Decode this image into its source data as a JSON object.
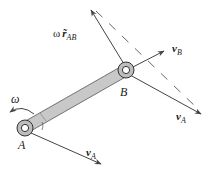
{
  "diagram": {
    "type": "rigid-body-velocity-diagram",
    "points": {
      "A": {
        "label": "A"
      },
      "B": {
        "label": "B"
      }
    },
    "labels": {
      "omega": "ω",
      "omega_r_prefix": "ω",
      "r_symbol": "r̃",
      "r_subscript": "AB",
      "vB_main": "v",
      "vB_sub": "B",
      "vA_atB_main": "v",
      "vA_atB_sub": "A",
      "vA_atA_main": "v",
      "vA_atA_sub": "A"
    },
    "colors": {
      "rod_fill": "#c8c8c8",
      "rod_stroke": "#555555",
      "pin_ring": "#bdbdbd",
      "arrow": "#444444",
      "dashed": "#555555"
    }
  }
}
